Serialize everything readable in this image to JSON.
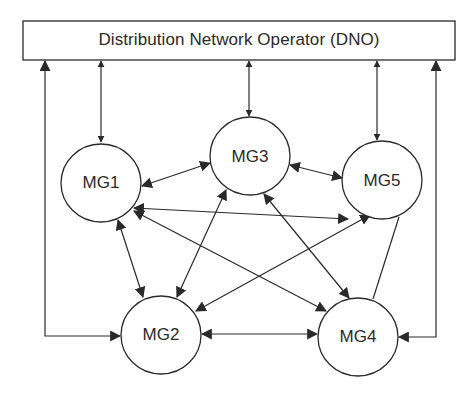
{
  "dno": {
    "label": "Distribution Network Operator (DNO)"
  },
  "nodes": [
    {
      "id": "MG1",
      "label": "MG1",
      "cx": 101,
      "cy": 183,
      "r": 40
    },
    {
      "id": "MG2",
      "label": "MG2",
      "cx": 161,
      "cy": 334,
      "r": 40
    },
    {
      "id": "MG3",
      "label": "MG3",
      "cx": 250,
      "cy": 157,
      "r": 40
    },
    {
      "id": "MG4",
      "label": "MG4",
      "cx": 358,
      "cy": 337,
      "r": 40
    },
    {
      "id": "MG5",
      "label": "MG5",
      "cx": 382,
      "cy": 180,
      "r": 40
    }
  ],
  "edges": [
    {
      "from": "DNO",
      "to": "MG1",
      "type": "bidirectional"
    },
    {
      "from": "DNO",
      "to": "MG3",
      "type": "bidirectional"
    },
    {
      "from": "DNO",
      "to": "MG5",
      "type": "bidirectional"
    },
    {
      "from": "DNO",
      "to": "MG2",
      "type": "bidirectional",
      "route": "left outer"
    },
    {
      "from": "DNO",
      "to": "MG4",
      "type": "bidirectional",
      "route": "right outer"
    },
    {
      "from": "MG1",
      "to": "MG3",
      "type": "bidirectional"
    },
    {
      "from": "MG1",
      "to": "MG2",
      "type": "bidirectional"
    },
    {
      "from": "MG1",
      "to": "MG5",
      "type": "bidirectional"
    },
    {
      "from": "MG1",
      "to": "MG4",
      "type": "bidirectional"
    },
    {
      "from": "MG3",
      "to": "MG5",
      "type": "bidirectional"
    },
    {
      "from": "MG3",
      "to": "MG2",
      "type": "bidirectional"
    },
    {
      "from": "MG3",
      "to": "MG4",
      "type": "bidirectional"
    },
    {
      "from": "MG5",
      "to": "MG2",
      "type": "bidirectional"
    },
    {
      "from": "MG5",
      "to": "MG4",
      "type": "line"
    },
    {
      "from": "MG2",
      "to": "MG4",
      "type": "bidirectional"
    }
  ],
  "colors": {
    "stroke": "#2a2a2a",
    "background": "#ffffff"
  }
}
